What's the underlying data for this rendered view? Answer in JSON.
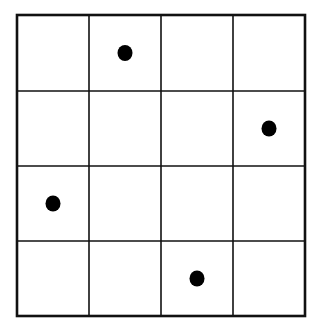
{
  "diagram": {
    "type": "grid-with-dots",
    "rows": 4,
    "cols": 4,
    "grid_color": "#111111",
    "dot_color": "#000000",
    "background": "#ffffff",
    "bounds": {
      "left": 17,
      "top": 15,
      "right": 305,
      "bottom": 316
    },
    "col_edges": [
      17,
      89,
      161,
      233,
      305
    ],
    "row_edges": [
      15,
      91,
      166,
      241,
      316
    ],
    "dots": [
      {
        "row": 0,
        "col": 1
      },
      {
        "row": 1,
        "col": 3
      },
      {
        "row": 2,
        "col": 0
      },
      {
        "row": 3,
        "col": 2
      }
    ]
  }
}
